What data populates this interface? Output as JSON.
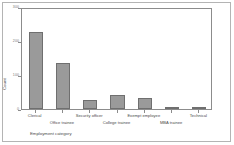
{
  "chart_data": {
    "type": "bar",
    "title": "",
    "subtitle": "",
    "xlabel": "Employment category",
    "ylabel": "Count",
    "categories": [
      "Clerical",
      "Office trainee",
      "Security officer",
      "College trainee",
      "Exempt employee",
      "MBA trainee",
      "Technical"
    ],
    "values": [
      227,
      136,
      27,
      41,
      32,
      4,
      1
    ],
    "ylim": [
      0,
      300
    ],
    "yticks": [
      0,
      100,
      200,
      300
    ],
    "ytick_labels": [
      "0",
      "100",
      "200",
      "300"
    ],
    "grid": false,
    "legend": null,
    "bar_color": "#9a9a9a",
    "bar_edge_color": "#6f6f6f",
    "frame_color": "#8c8c8c",
    "background_color": "#ffffff",
    "border_color": "#b4b4b4",
    "label_rows": [
      0,
      1,
      0,
      1,
      0,
      1,
      0
    ]
  }
}
